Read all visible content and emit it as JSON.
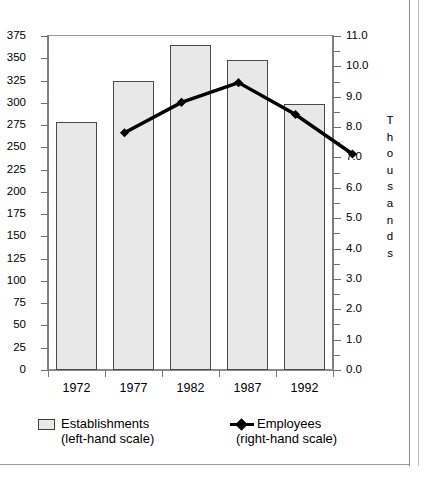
{
  "chart_data": {
    "type": "bar",
    "title": "",
    "subtitle": "",
    "xlabel": "",
    "ylabel": "",
    "ylabel_right": "Thousands",
    "grid": false,
    "legend_position": "bottom",
    "categories": [
      "1972",
      "1977",
      "1982",
      "1987",
      "1992"
    ],
    "series": [
      {
        "name": "Establishments",
        "scale": "left",
        "type": "bar",
        "values": [
          278,
          324,
          365,
          348,
          299
        ]
      },
      {
        "name": "Employees",
        "scale": "right",
        "type": "line",
        "values": [
          9.0,
          10.0,
          10.65,
          9.6,
          8.3
        ]
      }
    ],
    "axes": {
      "left": {
        "min": 0,
        "max": 375,
        "step": 25,
        "ticks": [
          "375",
          "350",
          "325",
          "300",
          "275",
          "250",
          "225",
          "200",
          "175",
          "150",
          "125",
          "100",
          "75",
          "50",
          "25",
          "0"
        ]
      },
      "right": {
        "min": 0.0,
        "max": 11.0,
        "step": 1.0,
        "minor_step": 0.5,
        "label": "Thousands",
        "ticks": [
          "11.0",
          "10.0",
          "9.0",
          "8.0",
          "7.0",
          "6.0",
          "5.0",
          "4.0",
          "3.0",
          "2.0",
          "1.0",
          "0.0"
        ]
      }
    },
    "colors": {
      "bar_fill": "#e8e8e8",
      "bar_stroke": "#4a4a4a",
      "line": "#000000",
      "axis": "#7f7f7f",
      "text": "#000000"
    }
  },
  "legend": {
    "items": [
      {
        "label": "Establishments",
        "sublabel": "(left-hand scale)",
        "marker": "square-swatch"
      },
      {
        "label": "Employees",
        "sublabel": "(right-hand scale)",
        "marker": "line-diamond-marker"
      }
    ]
  }
}
